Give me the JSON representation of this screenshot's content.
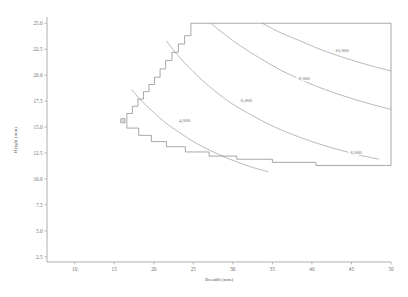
{
  "chart_data": {
    "type": "line",
    "title": "",
    "subtitle": "",
    "xlabel": "Breadth (mm)",
    "ylabel": "Height (mm)",
    "xlim": [
      6.5,
      50
    ],
    "ylim": [
      2.0,
      25.6
    ],
    "grid": false,
    "legend": "none",
    "x_ticks": [
      10,
      15,
      20,
      25,
      30,
      35,
      40,
      45,
      50
    ],
    "x_tick_labels": [
      "10",
      "15",
      "20",
      "25",
      "30",
      "35",
      "40",
      "45",
      "50"
    ],
    "y_ticks": [
      2.5,
      5.0,
      7.5,
      10.0,
      12.5,
      15.0,
      17.5,
      20.0,
      22.5,
      25.0
    ],
    "y_tick_labels": [
      "2.5",
      "5.0",
      "7.5",
      "10.0",
      "12.5",
      "15.0",
      "17.5",
      "20.0",
      "22.5",
      "25.0"
    ],
    "contours": [
      {
        "label": "4,000",
        "level": 4000,
        "label_x": 23.9,
        "label_y": 15.6,
        "points": [
          [
            17.2,
            18.6
          ],
          [
            18.0,
            17.9
          ],
          [
            19.0,
            17.1
          ],
          [
            20.0,
            16.4
          ],
          [
            21.5,
            15.4
          ],
          [
            23.0,
            14.6
          ],
          [
            25.0,
            13.6
          ],
          [
            27.0,
            12.8
          ],
          [
            29.0,
            12.1
          ],
          [
            31.0,
            11.5
          ],
          [
            33.0,
            11.0
          ],
          [
            34.5,
            10.7
          ]
        ]
      },
      {
        "label": "6,000",
        "level": 6000,
        "label_x": 31.7,
        "label_y": 17.6,
        "points": [
          [
            21.6,
            23.3
          ],
          [
            22.5,
            22.4
          ],
          [
            24.0,
            21.1
          ],
          [
            26.0,
            19.6
          ],
          [
            28.0,
            18.3
          ],
          [
            30.0,
            17.2
          ],
          [
            32.5,
            16.1
          ],
          [
            35.0,
            15.1
          ],
          [
            37.5,
            14.3
          ],
          [
            40.0,
            13.6
          ],
          [
            43.0,
            12.9
          ],
          [
            46.0,
            12.3
          ],
          [
            48.5,
            11.9
          ]
        ]
      },
      {
        "label": "6,000",
        "level": 6000,
        "label_x": 45.6,
        "label_y": 12.6,
        "points": []
      },
      {
        "label": "8,000",
        "level": 8000,
        "label_x": 39.0,
        "label_y": 19.7,
        "points": [
          [
            27.2,
            25.0
          ],
          [
            29.0,
            23.9
          ],
          [
            31.0,
            22.8
          ],
          [
            33.5,
            21.6
          ],
          [
            36.0,
            20.5
          ],
          [
            38.5,
            19.6
          ],
          [
            41.0,
            18.8
          ],
          [
            44.0,
            18.0
          ],
          [
            47.0,
            17.3
          ],
          [
            50.0,
            16.7
          ]
        ]
      },
      {
        "label": "10,000",
        "level": 10000,
        "label_x": 43.8,
        "label_y": 22.4,
        "points": [
          [
            33.7,
            25.0
          ],
          [
            36.0,
            24.1
          ],
          [
            38.5,
            23.3
          ],
          [
            41.0,
            22.5
          ],
          [
            44.0,
            21.7
          ],
          [
            47.0,
            21.0
          ],
          [
            50.0,
            20.4
          ]
        ]
      }
    ],
    "feasible_region": {
      "description": "stepped feasible region boundary",
      "marker": {
        "x": 16.1,
        "y": 15.6
      },
      "upper_staircase": [
        [
          16.6,
          15.6
        ],
        [
          16.6,
          16.3
        ],
        [
          17.3,
          16.3
        ],
        [
          17.3,
          17.0
        ],
        [
          18.0,
          17.0
        ],
        [
          18.0,
          17.7
        ],
        [
          18.7,
          17.7
        ],
        [
          18.7,
          18.4
        ],
        [
          19.4,
          18.4
        ],
        [
          19.4,
          19.1
        ],
        [
          20.1,
          19.1
        ],
        [
          20.1,
          19.8
        ],
        [
          20.8,
          19.8
        ],
        [
          20.8,
          20.6
        ],
        [
          21.5,
          20.6
        ],
        [
          21.5,
          21.4
        ],
        [
          22.3,
          21.4
        ],
        [
          22.3,
          22.2
        ],
        [
          23.1,
          22.2
        ],
        [
          23.1,
          23.0
        ],
        [
          23.9,
          23.0
        ],
        [
          23.9,
          23.8
        ],
        [
          24.7,
          23.8
        ],
        [
          24.7,
          25.0
        ],
        [
          50.0,
          25.0
        ]
      ],
      "lower_staircase": [
        [
          16.6,
          15.6
        ],
        [
          16.6,
          14.9
        ],
        [
          18.1,
          14.9
        ],
        [
          18.1,
          14.2
        ],
        [
          19.7,
          14.2
        ],
        [
          19.7,
          13.6
        ],
        [
          21.6,
          13.6
        ],
        [
          21.6,
          13.1
        ],
        [
          24.0,
          13.1
        ],
        [
          24.0,
          12.6
        ],
        [
          27.0,
          12.6
        ],
        [
          27.0,
          12.2
        ],
        [
          30.5,
          12.2
        ],
        [
          30.5,
          11.9
        ],
        [
          35.0,
          11.9
        ],
        [
          35.0,
          11.6
        ],
        [
          40.5,
          11.6
        ],
        [
          40.5,
          11.3
        ],
        [
          50.0,
          11.3
        ]
      ],
      "right_edge": [
        [
          50.0,
          11.3
        ],
        [
          50.0,
          25.0
        ]
      ]
    }
  },
  "axes": {
    "x_axis_title": "Breadth (mm)",
    "y_axis_title": "Height (mm)"
  }
}
